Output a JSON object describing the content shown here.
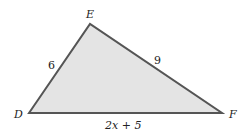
{
  "figure": {
    "type": "triangle",
    "fill": "#e4e4e4",
    "stroke": "#555555",
    "vertices": [
      {
        "name": "D",
        "label": "D"
      },
      {
        "name": "E",
        "label": "E"
      },
      {
        "name": "F",
        "label": "F"
      }
    ],
    "sides": {
      "DE": "6",
      "EF": "9",
      "DF": "2x + 5"
    }
  }
}
